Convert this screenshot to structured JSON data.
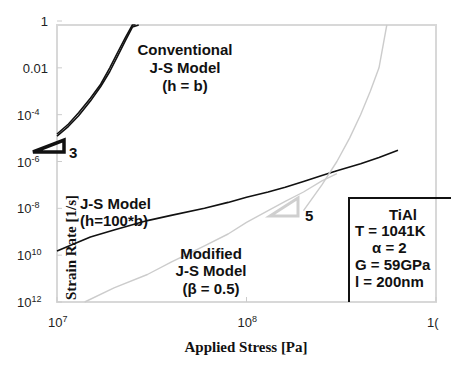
{
  "chart_data": {
    "type": "line",
    "title": "",
    "xlabel": "Applied Stress [Pa]",
    "ylabel": "Strain Rate [1/s]",
    "xscale": "log",
    "yscale": "log",
    "xlim": [
      10000000.0,
      1000000000.0
    ],
    "ylim": [
      1e-12,
      1
    ],
    "x_ticks": [
      {
        "value": 10000000.0,
        "base": "10",
        "exp": "7"
      },
      {
        "value": 100000000.0,
        "base": "10",
        "exp": "8"
      },
      {
        "value": 1000000000.0,
        "base": "1(",
        "exp": ""
      }
    ],
    "y_ticks": [
      {
        "value": 1,
        "base": "1",
        "exp": ""
      },
      {
        "value": 0.01,
        "base": "0.01",
        "exp": ""
      },
      {
        "value": 0.0001,
        "base": "10",
        "exp": "-4"
      },
      {
        "value": 1e-06,
        "base": "10",
        "exp": "-6"
      },
      {
        "value": 1e-08,
        "base": "10",
        "exp": "-8"
      },
      {
        "value": 1e-10,
        "base": "10",
        "exp": "10"
      },
      {
        "value": 1e-12,
        "base": "10",
        "exp": "12"
      }
    ],
    "series": [
      {
        "name": "Conventional J-S Model (h = b) upper",
        "color": "#111111",
        "x": [
          10000000.0,
          11500000.0,
          13000000.0,
          15000000.0,
          17000000.0,
          19000000.0,
          21000000.0,
          23000000.0,
          25000000.0,
          26000000.0
        ],
        "y": [
          1.5e-05,
          4e-05,
          0.00012,
          0.0005,
          0.002,
          0.01,
          0.05,
          0.2,
          0.7,
          1.0
        ]
      },
      {
        "name": "Conventional J-S Model (h = b) lower",
        "color": "#111111",
        "x": [
          10000000.0,
          11500000.0,
          13000000.0,
          15000000.0,
          17000000.0,
          19000000.0,
          21000000.0,
          23000000.0,
          25000000.0,
          27000000.0
        ],
        "y": [
          1.2e-05,
          3.2e-05,
          9e-05,
          0.00038,
          0.0016,
          0.007,
          0.035,
          0.15,
          0.55,
          1.0
        ]
      },
      {
        "name": "J-S Model (h=100*b)",
        "color": "#111111",
        "x": [
          10000000.0,
          15000000.0,
          20000000.0,
          30000000.0,
          40000000.0,
          60000000.0,
          80000000.0,
          100000000.0,
          130000000.0,
          160000000.0,
          200000000.0,
          250000000.0,
          300000000.0,
          400000000.0,
          500000000.0,
          630000000.0
        ],
        "y": [
          1.5e-10,
          6e-10,
          1.2e-09,
          3e-09,
          5e-09,
          1e-08,
          1.8e-08,
          3e-08,
          5e-08,
          8e-08,
          1.4e-07,
          2.5e-07,
          4e-07,
          8e-07,
          1.5e-06,
          3e-06
        ]
      },
      {
        "name": "Modified J-S Model (β = 0.5) lower",
        "color": "#cccccc",
        "x": [
          14000000.0,
          20000000.0,
          30000000.0,
          40000000.0,
          60000000.0,
          80000000.0,
          100000000.0,
          130000000.0,
          160000000.0,
          200000000.0,
          250000000.0,
          300000000.0
        ],
        "y": [
          1e-12,
          4e-12,
          1.5e-11,
          5e-11,
          2.5e-10,
          8e-10,
          2.5e-09,
          8e-09,
          2e-08,
          5e-08,
          1.5e-07,
          3e-07
        ]
      },
      {
        "name": "Modified J-S Model (β = 0.5) upper",
        "color": "#cccccc",
        "x": [
          200000000.0,
          250000000.0,
          300000000.0,
          350000000.0,
          400000000.0,
          450000000.0,
          500000000.0,
          550000000.0
        ],
        "y": [
          8e-09,
          1e-07,
          1e-06,
          1e-05,
          0.0001,
          0.001,
          0.01,
          1.0
        ]
      }
    ],
    "annotations": [
      {
        "id": "conv",
        "lines": [
          "Conventional",
          "J-S Model",
          "(h = b)"
        ]
      },
      {
        "id": "js100",
        "lines": [
          "J-S Model",
          "(h=100*b)"
        ]
      },
      {
        "id": "modified",
        "lines": [
          "Modified",
          "J-S Model",
          "(β = 0.5)"
        ]
      },
      {
        "id": "slope3",
        "label": "3",
        "slope": 3,
        "color": "#111111"
      },
      {
        "id": "slope5",
        "label": "5",
        "slope": 5,
        "color": "#cccccc"
      }
    ],
    "legend_box": {
      "position": "bottom-right",
      "lines": [
        "TiAl",
        "T = 1041K",
        "α = 2",
        "G = 59GPa",
        "l = 200nm"
      ]
    },
    "grid": false
  }
}
